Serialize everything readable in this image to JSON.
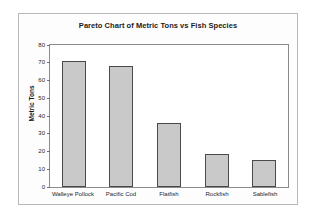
{
  "figure": {
    "background_color": "#fdfdfd",
    "border_color": "#b9b9bd"
  },
  "chart_data": {
    "type": "bar",
    "title": "Pareto Chart of Metric Tons vs Fish Species",
    "xlabel": "",
    "ylabel": "Metric Tons",
    "categories": [
      "Walleye Pollock",
      "Pacific Cod",
      "Flatfish",
      "Rockfish",
      "Sablefish"
    ],
    "values": [
      71,
      68,
      36,
      18.5,
      15
    ],
    "ylim": [
      0,
      80
    ],
    "yticks": [
      0,
      10,
      20,
      30,
      40,
      50,
      60,
      70,
      80
    ],
    "ytick_labels": [
      "0",
      "10",
      "20",
      "30",
      "40",
      "50",
      "60",
      "70",
      "80"
    ],
    "grid": false,
    "legend": null,
    "bar_fill_color": "#c9c9c9",
    "bar_edge_color": "#4a4a4a",
    "axis_color": "#8a8a8f"
  }
}
